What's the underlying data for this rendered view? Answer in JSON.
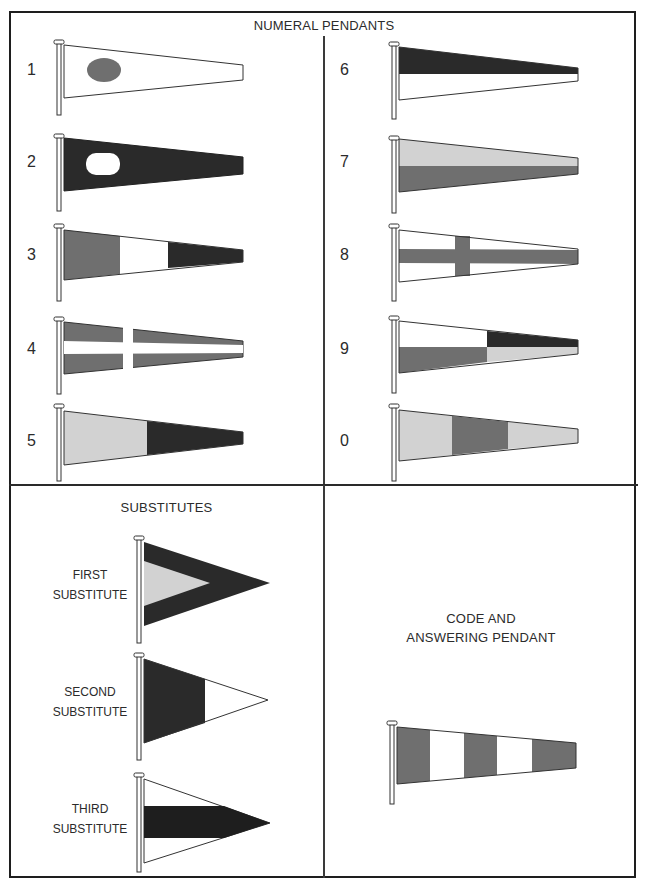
{
  "header_fragment": "(cont.)",
  "sections": {
    "numeral": {
      "title": "NUMERAL PENDANTS",
      "pendants": [
        {
          "label": "1",
          "design": "white field, gray oval disc at hoist"
        },
        {
          "label": "2",
          "design": "dark field, white oval disc at hoist"
        },
        {
          "label": "3",
          "design": "vertical thirds: gray, white, dark"
        },
        {
          "label": "4",
          "design": "gray field with white cross"
        },
        {
          "label": "5",
          "design": "vertical halves: light gray, dark"
        },
        {
          "label": "6",
          "design": "horizontal halves: dark over white"
        },
        {
          "label": "7",
          "design": "horizontal halves: light gray over gray"
        },
        {
          "label": "8",
          "design": "white field with gray cross"
        },
        {
          "label": "9",
          "design": "quartered: white, dark, gray, light gray"
        },
        {
          "label": "0",
          "design": "vertical thirds: light gray, gray, light gray"
        }
      ]
    },
    "substitutes": {
      "title": "SUBSTITUTES",
      "items": [
        {
          "line1": "FIRST",
          "line2": "SUBSTITUTE",
          "design": "dark triangle with light gray inner triangle"
        },
        {
          "line1": "SECOND",
          "line2": "SUBSTITUTE",
          "design": "vertical halves: dark hoist, white fly"
        },
        {
          "line1": "THIRD",
          "line2": "SUBSTITUTE",
          "design": "white with dark horizontal band"
        }
      ]
    },
    "code": {
      "title_line1": "CODE AND",
      "title_line2": "ANSWERING PENDANT",
      "design": "five vertical stripes: gray, white, gray, white, gray"
    }
  },
  "colors": {
    "dark": "#2a2a2a",
    "gray": "#6f6f6f",
    "light": "#d2d2d2",
    "white": "#ffffff",
    "outline": "#333333"
  }
}
